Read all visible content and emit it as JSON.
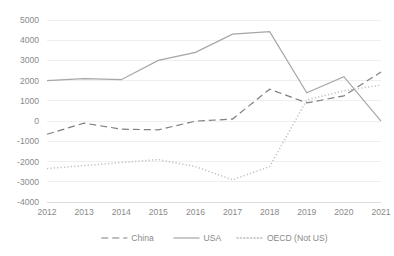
{
  "chart_data": {
    "type": "line",
    "title": "",
    "subtitle": "",
    "xlabel": "",
    "ylabel": "",
    "categories": [
      "2012",
      "2013",
      "2014",
      "2015",
      "2016",
      "2017",
      "2018",
      "2019",
      "2020",
      "2021"
    ],
    "x": [
      2012,
      2013,
      2014,
      2015,
      2016,
      2017,
      2018,
      2019,
      2020,
      2021
    ],
    "ylim": [
      -4000,
      5000
    ],
    "ytick_step": 1000,
    "yticks": [
      5000,
      4000,
      3000,
      2000,
      1000,
      0,
      -1000,
      -2000,
      -3000,
      -4000
    ],
    "ytick_labels": [
      "5000",
      "4000",
      "3000",
      "2000",
      "1000",
      "0",
      "-1000",
      "-2000",
      "-3000",
      "-4000"
    ],
    "grid": true,
    "grid_axis": "y",
    "legend_position": "bottom",
    "series": [
      {
        "name": "China",
        "style": "dashed",
        "color": "#7f7f7f",
        "values": [
          -650,
          -100,
          -400,
          -430,
          0,
          100,
          1580,
          900,
          1250,
          2430
        ]
      },
      {
        "name": "USA",
        "style": "solid",
        "color": "#a6a6a6",
        "values": [
          2000,
          2100,
          2050,
          3000,
          3400,
          4300,
          4420,
          1400,
          2200,
          0
        ]
      },
      {
        "name": "OECD (Not US)",
        "style": "dotted",
        "color": "#bfbfbf",
        "values": [
          -2350,
          -2200,
          -2050,
          -1900,
          -2250,
          -2900,
          -2250,
          1050,
          1500,
          1780
        ]
      }
    ]
  },
  "legend": {
    "items": [
      {
        "label": "China",
        "style": "dashed"
      },
      {
        "label": "USA",
        "style": "solid"
      },
      {
        "label": "OECD (Not US)",
        "style": "dotted"
      }
    ]
  },
  "colors": {
    "grid": "#e8e8e8",
    "axis": "#d6d6d6",
    "text": "#8a8a8a",
    "china": "#7f7f7f",
    "usa": "#a6a6a6",
    "oecd": "#bfbfbf",
    "background": "#ffffff"
  }
}
